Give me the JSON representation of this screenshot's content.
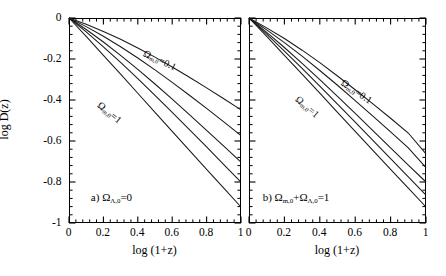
{
  "figure": {
    "background": "#ffffff",
    "ink": "#000000",
    "panels": 2
  },
  "axes": {
    "xlabel": "log (1+z)",
    "ylabel": "log D(z)",
    "xticks": [
      "0",
      "0.2",
      "0.4",
      "0.6",
      "0.8",
      "1"
    ],
    "xtick_values": [
      0,
      0.2,
      0.4,
      0.6,
      0.8,
      1.0
    ],
    "yticks": [
      "0",
      "-0.2",
      "-0.4",
      "-0.6",
      "-0.8",
      "-1"
    ],
    "ytick_values": [
      0,
      -0.2,
      -0.4,
      -0.6,
      -0.8,
      -1.0
    ],
    "xlim": [
      0,
      1
    ],
    "ylim": [
      -1,
      0
    ],
    "minor_ticks_per_interval": 4,
    "ticks_direction": "inward",
    "grid": false
  },
  "panel_a": {
    "tag": "a)",
    "condition_omega": "Ω",
    "condition_sub": "Λ,0",
    "condition_eq": "=0",
    "label_high": {
      "omega": "Ω",
      "sub": "m,0",
      "eq": "=0.1"
    },
    "label_low": {
      "omega": "Ω",
      "sub": "m,0",
      "eq": "=1"
    }
  },
  "panel_b": {
    "tag": "b)",
    "condition_omega1": "Ω",
    "condition_sub1": "m,0",
    "condition_plus": "+",
    "condition_omega2": "Ω",
    "condition_sub2": "Λ,0",
    "condition_eq": "=1",
    "label_high": {
      "omega": "Ω",
      "sub": "m,0",
      "eq": "=0.1"
    },
    "label_low": {
      "omega": "Ω",
      "sub": "m,0",
      "eq": "=1"
    }
  },
  "chart_data": [
    {
      "type": "line",
      "title": "a) Omega_Lambda,0 = 0",
      "xlabel": "log (1+z)",
      "ylabel": "log D(z)",
      "xlim": [
        0,
        1
      ],
      "ylim": [
        -1,
        0
      ],
      "grid": false,
      "legend_position": "inline-annotations",
      "x": [
        0.0,
        0.1,
        0.2,
        0.3,
        0.4,
        0.5,
        0.6,
        0.7,
        0.8,
        0.9,
        1.0
      ],
      "series": [
        {
          "name": "Ω_m,0 = 0.1",
          "values": [
            0.0,
            -0.031,
            -0.066,
            -0.104,
            -0.146,
            -0.191,
            -0.239,
            -0.289,
            -0.341,
            -0.394,
            -0.448
          ]
        },
        {
          "name": "Ω_m,0 = 0.2",
          "values": [
            0.0,
            -0.042,
            -0.089,
            -0.14,
            -0.195,
            -0.253,
            -0.314,
            -0.377,
            -0.441,
            -0.507,
            -0.574
          ]
        },
        {
          "name": "Ω_m,0 = 0.4",
          "values": [
            0.0,
            -0.056,
            -0.117,
            -0.182,
            -0.251,
            -0.322,
            -0.396,
            -0.471,
            -0.548,
            -0.625,
            -0.703
          ]
        },
        {
          "name": "Ω_m,0 = 0.6",
          "values": [
            0.0,
            -0.068,
            -0.141,
            -0.217,
            -0.296,
            -0.377,
            -0.46,
            -0.544,
            -0.629,
            -0.715,
            -0.801
          ]
        },
        {
          "name": "Ω_m,0 = 1",
          "values": [
            0.0,
            -0.09,
            -0.182,
            -0.274,
            -0.367,
            -0.46,
            -0.553,
            -0.646,
            -0.738,
            -0.83,
            -0.922
          ]
        }
      ],
      "annotations": [
        {
          "text": "a) Ω_Λ,0=0",
          "x": 0.18,
          "y": -0.86
        },
        {
          "text": "Ω_m,0=0.1",
          "x": 0.47,
          "y": -0.17
        },
        {
          "text": "Ω_m,0=1",
          "x": 0.21,
          "y": -0.45
        }
      ]
    },
    {
      "type": "line",
      "title": "b) Omega_m,0 + Omega_Lambda,0 = 1",
      "xlabel": "log (1+z)",
      "ylabel": "log D(z)",
      "xlim": [
        0,
        1
      ],
      "ylim": [
        -1,
        0
      ],
      "grid": false,
      "legend_position": "inline-annotations",
      "x": [
        0.0,
        0.1,
        0.2,
        0.3,
        0.4,
        0.5,
        0.6,
        0.7,
        0.8,
        0.9,
        1.0
      ],
      "series": [
        {
          "name": "Ω_m,0 = 0.1",
          "values": [
            0.0,
            -0.048,
            -0.1,
            -0.157,
            -0.218,
            -0.283,
            -0.35,
            -0.419,
            -0.489,
            -0.561,
            -0.663
          ]
        },
        {
          "name": "Ω_m,0 = 0.2",
          "values": [
            0.0,
            -0.058,
            -0.12,
            -0.186,
            -0.256,
            -0.328,
            -0.403,
            -0.479,
            -0.556,
            -0.634,
            -0.73
          ]
        },
        {
          "name": "Ω_m,0 = 0.4",
          "values": [
            0.0,
            -0.07,
            -0.144,
            -0.221,
            -0.301,
            -0.382,
            -0.465,
            -0.549,
            -0.633,
            -0.718,
            -0.8
          ]
        },
        {
          "name": "Ω_m,0 = 0.6",
          "values": [
            0.0,
            -0.079,
            -0.161,
            -0.246,
            -0.332,
            -0.42,
            -0.508,
            -0.597,
            -0.686,
            -0.775,
            -0.864
          ]
        },
        {
          "name": "Ω_m,0 = 1",
          "values": [
            0.0,
            -0.09,
            -0.182,
            -0.274,
            -0.367,
            -0.46,
            -0.553,
            -0.646,
            -0.738,
            -0.83,
            -0.922
          ]
        }
      ],
      "annotations": [
        {
          "text": "b) Ω_m,0+Ω_Λ,0=1",
          "x": 0.17,
          "y": -0.86
        },
        {
          "text": "Ω_m,0=0.1",
          "x": 0.6,
          "y": -0.33
        },
        {
          "text": "Ω_m,0=1",
          "x": 0.3,
          "y": -0.4
        }
      ]
    }
  ]
}
